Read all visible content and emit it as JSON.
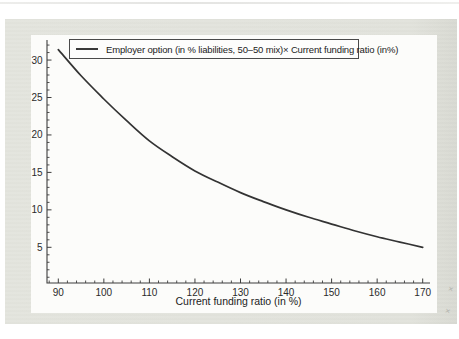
{
  "colors": {
    "page_panel": "#e2e3dc",
    "figure_background": "#fcfcfa",
    "axis": "#3d3d3d",
    "text": "#2b2b2b",
    "curve": "#333333"
  },
  "artifact_glyph": "×",
  "chart_data": {
    "type": "line",
    "title": "",
    "xlabel": "Current funding ratio (in %)",
    "ylabel": "",
    "legend_position": "top-left-inside",
    "grid": false,
    "xlim": [
      87.5,
      171.5
    ],
    "ylim": [
      0,
      32.5
    ],
    "x_ticks": [
      90,
      100,
      110,
      120,
      130,
      140,
      150,
      160,
      170
    ],
    "y_ticks": [
      5,
      10,
      15,
      20,
      25,
      30
    ],
    "minor_x_step": 2,
    "minor_y_step": 1,
    "series": [
      {
        "name": "Employer option (in % liabilities, 50–50 mix)× Current funding ratio (in%)",
        "color": "#333333",
        "x": [
          90,
          95,
          100,
          105,
          110,
          115,
          120,
          125,
          130,
          135,
          140,
          145,
          150,
          155,
          160,
          165,
          170
        ],
        "values": [
          31.4,
          27.9,
          24.8,
          21.9,
          19.2,
          17.1,
          15.2,
          13.7,
          12.3,
          11.1,
          10.0,
          9.0,
          8.1,
          7.2,
          6.4,
          5.7,
          5.0
        ]
      }
    ]
  }
}
